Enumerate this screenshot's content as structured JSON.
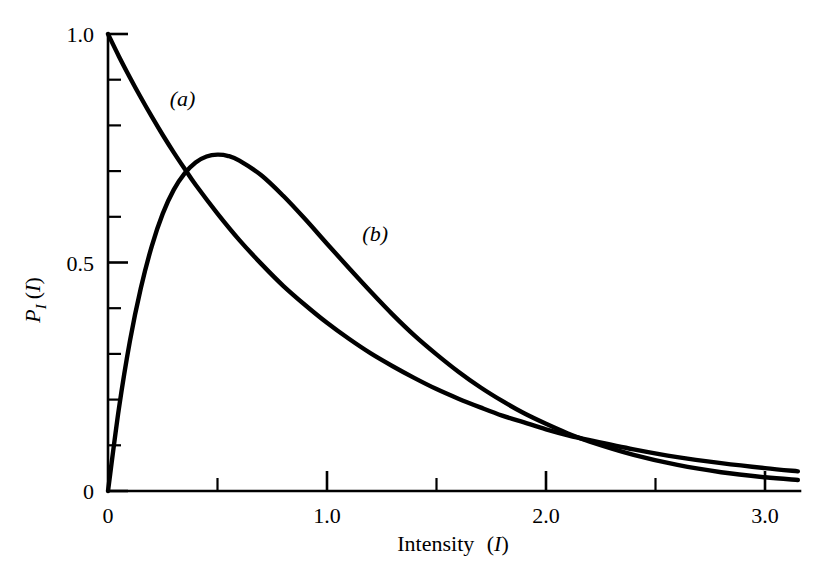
{
  "chart_data": {
    "type": "line",
    "title": "",
    "xlabel": "Intensity (I)",
    "xlabel_plain": "Intensity",
    "xlabel_symbol": "I",
    "ylabel": "P_I (I)",
    "ylabel_main": "P",
    "ylabel_sub": "I",
    "ylabel_arg": "(I)",
    "xlim": [
      0,
      3.15
    ],
    "ylim": [
      0,
      1.0
    ],
    "grid": false,
    "legend": "inline-curve-tags",
    "x_ticks_major": [
      {
        "value": 0,
        "label": "0"
      },
      {
        "value": 1.0,
        "label": "1.0"
      },
      {
        "value": 2.0,
        "label": "2.0"
      },
      {
        "value": 3.0,
        "label": "3.0"
      }
    ],
    "x_ticks_minor": [
      0.5,
      1.5,
      2.5
    ],
    "y_ticks_major": [
      {
        "value": 0,
        "label": "0"
      },
      {
        "value": 0.5,
        "label": "0.5"
      },
      {
        "value": 1.0,
        "label": "1.0"
      }
    ],
    "y_ticks_minor": [
      0.1,
      0.2,
      0.3,
      0.4,
      0.6,
      0.7,
      0.8,
      0.9
    ],
    "series": [
      {
        "name": "(a)",
        "tag": "(a)",
        "tag_x": 0.34,
        "tag_y": 0.86,
        "description": "negative-exponential probability density, P(I) = exp(-I)",
        "x": [
          0,
          0.05,
          0.1,
          0.15,
          0.2,
          0.25,
          0.3,
          0.35,
          0.4,
          0.5,
          0.6,
          0.7,
          0.8,
          0.9,
          1.0,
          1.1,
          1.2,
          1.3,
          1.4,
          1.5,
          1.6,
          1.7,
          1.8,
          1.9,
          2.0,
          2.1,
          2.2,
          2.4,
          2.6,
          2.8,
          3.0,
          3.15
        ],
        "values": [
          1.0,
          0.951,
          0.905,
          0.861,
          0.819,
          0.779,
          0.741,
          0.705,
          0.67,
          0.607,
          0.549,
          0.497,
          0.449,
          0.407,
          0.368,
          0.333,
          0.301,
          0.273,
          0.247,
          0.223,
          0.202,
          0.183,
          0.165,
          0.15,
          0.135,
          0.122,
          0.111,
          0.091,
          0.074,
          0.061,
          0.05,
          0.043
        ]
      },
      {
        "name": "(b)",
        "tag": "(b)",
        "tag_x": 1.22,
        "tag_y": 0.565,
        "description": "gamma / chi-square with 4 dof density, P(I) = 4 I exp(-2I), peak 0.736 at I = 0.5",
        "x": [
          0,
          0.05,
          0.1,
          0.15,
          0.2,
          0.25,
          0.3,
          0.35,
          0.4,
          0.45,
          0.5,
          0.55,
          0.6,
          0.7,
          0.8,
          0.9,
          1.0,
          1.1,
          1.2,
          1.3,
          1.4,
          1.5,
          1.6,
          1.7,
          1.8,
          1.9,
          2.0,
          2.1,
          2.2,
          2.4,
          2.6,
          2.8,
          3.0,
          3.15
        ],
        "values": [
          0.0,
          0.181,
          0.328,
          0.444,
          0.536,
          0.607,
          0.659,
          0.695,
          0.719,
          0.732,
          0.736,
          0.733,
          0.723,
          0.691,
          0.646,
          0.595,
          0.541,
          0.488,
          0.436,
          0.386,
          0.34,
          0.299,
          0.261,
          0.227,
          0.197,
          0.17,
          0.147,
          0.126,
          0.108,
          0.079,
          0.057,
          0.041,
          0.03,
          0.024
        ]
      }
    ],
    "notes": {
      "intersection_approx": {
        "x": 0.26,
        "y": 0.68
      },
      "peak_b": {
        "x": 0.5,
        "y": 0.736
      }
    }
  },
  "axes_geometry": {
    "origin_px": {
      "x": 108,
      "y": 491
    },
    "px_per_x_unit": 219,
    "px_per_y_unit": 457,
    "x_axis_end_px": 800,
    "y_axis_top_px": 34
  }
}
